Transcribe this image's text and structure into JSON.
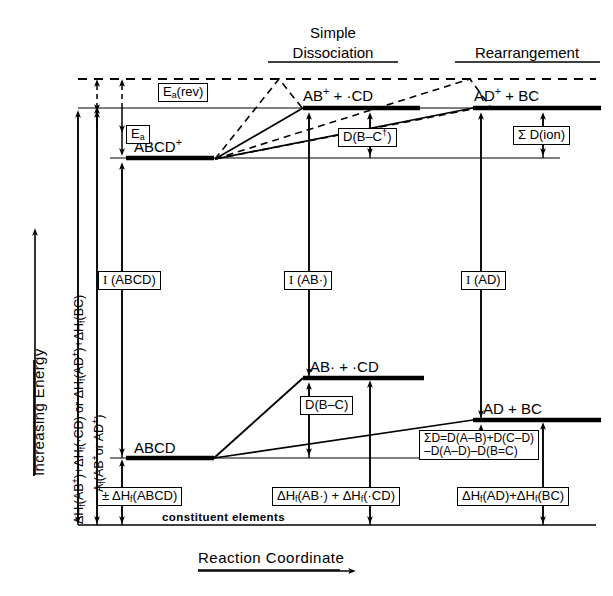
{
  "figure": {
    "type": "energy-level-diagram",
    "axes": {
      "y_axis_label": "Increasing Energy",
      "x_axis_label": "Reaction Coordinate",
      "baseline_label": "constituent elements"
    },
    "column_headers": [
      {
        "id": "simple-dissociation",
        "line1": "Simple",
        "line2": "Dissociation"
      },
      {
        "id": "rearrangement",
        "line1": "Rearrangement",
        "line2": ""
      }
    ],
    "left_axis_brackets": [
      {
        "id": "delta-hf-products",
        "text": "ΔHf(AB⁺)+ΔHf(·CD) or ΔHf(AD⁺)+ΔHf(BC)"
      },
      {
        "id": "appearance-potential",
        "text": "Af(AB⁺or AD⁺)"
      }
    ],
    "levels": [
      {
        "id": "transition-state",
        "label": "",
        "style": "dashed"
      },
      {
        "id": "ab-plus-cd-ion",
        "label": "AB⁺ + ·CD",
        "style": "thick"
      },
      {
        "id": "ad-plus-bc-ion",
        "label": "AD⁺ + BC",
        "style": "thick"
      },
      {
        "id": "abcd-ion",
        "label": "ABCD⁺",
        "style": "thick"
      },
      {
        "id": "ab-radical-cd-radical",
        "label": "AB· + ·CD",
        "style": "thick"
      },
      {
        "id": "ad-plus-bc-neutral",
        "label": "AD + BC",
        "style": "thick"
      },
      {
        "id": "abcd-neutral",
        "label": "ABCD",
        "style": "thick"
      }
    ],
    "measurement_labels": [
      {
        "id": "ea-rev",
        "html": "E<sub>a</sub>(rev)"
      },
      {
        "id": "ea",
        "html": "E<sub>a</sub>"
      },
      {
        "id": "d-b-c-dagger",
        "html": "D(B–C<sup>†</sup>)"
      },
      {
        "id": "sum-d-ion",
        "html": "Σ D(ion)"
      },
      {
        "id": "i-abcd",
        "html": "<span class='ser'>I</span> (ABCD)"
      },
      {
        "id": "i-ab-radical",
        "html": "<span class='ser'>I</span> (AB·)"
      },
      {
        "id": "i-ad",
        "html": "<span class='ser'>I</span> (AD)"
      },
      {
        "id": "d-b-c",
        "html": "D(B–C)"
      },
      {
        "id": "sum-d-equation",
        "html": "ΣD=D(A–B)+D(C–D)<br>–D(A–D)–D(B=C)"
      },
      {
        "id": "delta-hf-abcd",
        "html": "± ΔH<sub>f</sub>(ABCD)"
      },
      {
        "id": "delta-hf-ab-cd",
        "html": "ΔH<sub>f</sub>(AB·) + ΔH<sub>f</sub>(·CD)"
      },
      {
        "id": "delta-hf-ad-bc",
        "html": "ΔH<sub>f</sub>(AD)+ΔH<sub>f</sub>(BC)"
      }
    ]
  },
  "chart_data": {
    "type": "line",
    "xlabel": "Reaction Coordinate",
    "ylabel": "Increasing Energy",
    "grid": false,
    "legend": "none",
    "categories": [
      "ABCD",
      "ABCD⁺",
      "AB· + ·CD",
      "AB⁺ + ·CD",
      "AD + BC",
      "AD⁺ + BC",
      "transition state"
    ],
    "series": [
      {
        "name": "relative energy (arbitrary units, pixel-row of level line)",
        "values": [
          0,
          365,
          160,
          430,
          105,
          430,
          460
        ]
      }
    ],
    "levels_px": {
      "baseline_constituent_elements": 525,
      "abcd_neutral": 458,
      "ad_bc_neutral": 420,
      "ab_radical_cd": 378,
      "abcd_ion": 158,
      "ab_ion_cd": 108,
      "ad_ion_bc": 108,
      "transition_state_dashed": 79
    },
    "annotations": [
      "E_a(rev)",
      "E_a",
      "D(B-C†)",
      "Σ D(ion)",
      "I (ABCD)",
      "I (AB·)",
      "I (AD)",
      "D(B-C)",
      "ΣD=D(A-B)+D(C-D) -D(A-D)-D(B=C)",
      "± ΔH_f(ABCD)",
      "ΔH_f(AB·) + ΔH_f(·CD)",
      "ΔH_f(AD)+ΔH_f(BC)",
      "constituent elements"
    ]
  }
}
